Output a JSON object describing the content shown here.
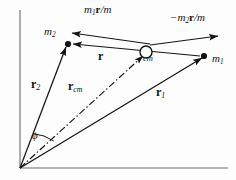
{
  "figure": {
    "colors": {
      "axis": "#9a9a9a",
      "vector": "#141414",
      "label": "#141414",
      "background": "#fdfdfd"
    },
    "axes": {
      "origin": [
        20,
        168
      ],
      "vertical_top": [
        20,
        10
      ],
      "horizontal_right": [
        228,
        168
      ]
    }
  },
  "points": {
    "origin": {
      "name": "origin",
      "x": 20,
      "y": 168
    },
    "m2": {
      "label": "m",
      "sub": "2",
      "x": 68,
      "y": 44,
      "marker": "filled-dot"
    },
    "m1": {
      "label": "m",
      "sub": "1",
      "x": 204,
      "y": 56,
      "marker": "filled-dot"
    },
    "cm": {
      "label": "cm",
      "x": 146,
      "y": 52,
      "marker": "open-circle"
    }
  },
  "labels": {
    "m2": {
      "text": "m",
      "sub": "2",
      "x": 44,
      "y": 33
    },
    "m1": {
      "text": "m",
      "sub": "1",
      "x": 212,
      "y": 60
    },
    "cm": {
      "text": "cm",
      "x": 143,
      "y": 58
    },
    "r_top_left": {
      "text": "m",
      "sub": "1",
      "tail": "r/m",
      "full": "m₁r/m",
      "x": 84,
      "y": 10
    },
    "r_top_right": {
      "text": "−m",
      "sub": "2",
      "tail": "r/m",
      "full": "−m₂r/m",
      "x": 170,
      "y": 18
    },
    "r": {
      "text": "r",
      "x": 98,
      "y": 56
    },
    "r2": {
      "text": "r",
      "sub": "2",
      "x": 31,
      "y": 84
    },
    "rcm": {
      "text": "r",
      "sub": "cm",
      "x": 68,
      "y": 86
    },
    "r1": {
      "text": "r",
      "sub": "1",
      "x": 156,
      "y": 92
    },
    "phi": {
      "text": "ϕ",
      "x": 32,
      "y": 136
    }
  },
  "vectors": [
    {
      "name": "r2-vector",
      "from": [
        20,
        168
      ],
      "to": [
        66,
        47
      ],
      "style": "solid",
      "arrow": "end"
    },
    {
      "name": "r1-vector",
      "from": [
        20,
        168
      ],
      "to": [
        202,
        58
      ],
      "style": "solid",
      "arrow": "end"
    },
    {
      "name": "rcm-vector",
      "from": [
        20,
        168
      ],
      "to": [
        143,
        56
      ],
      "style": "dash-dot",
      "arrow": "end"
    },
    {
      "name": "r-vector",
      "from": [
        200,
        56
      ],
      "to": [
        73,
        44
      ],
      "style": "solid",
      "arrow": "end"
    },
    {
      "name": "m1r-over-m-vector",
      "from": [
        150,
        44
      ],
      "to": [
        72,
        33
      ],
      "style": "solid",
      "arrow": "end"
    },
    {
      "name": "minus-m2r-over-m-vector",
      "from": [
        150,
        45
      ],
      "to": [
        218,
        36
      ],
      "style": "solid",
      "arrow": "end"
    }
  ],
  "angle_arc": {
    "name": "phi-angle-arc",
    "vertex": [
      20,
      168
    ],
    "from_vector": "r2-vector",
    "to_vector": "rcm-vector",
    "symbol": "ϕ"
  }
}
